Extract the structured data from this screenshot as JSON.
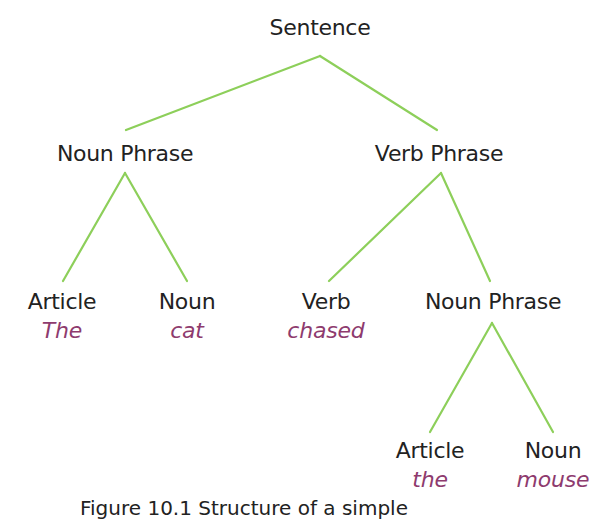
{
  "diagram": {
    "type": "parse-tree",
    "edge_color": "#8dcf5a",
    "word_color": "#8e3b6e",
    "nodes": [
      {
        "id": "s",
        "label": "Sentence",
        "word": null,
        "x": 320,
        "y": 14
      },
      {
        "id": "np1",
        "label": "Noun Phrase",
        "word": null,
        "x": 125,
        "y": 140
      },
      {
        "id": "vp",
        "label": "Verb Phrase",
        "word": null,
        "x": 439,
        "y": 140
      },
      {
        "id": "art1",
        "label": "Article",
        "word": "The",
        "x": 62,
        "y": 288
      },
      {
        "id": "n1",
        "label": "Noun",
        "word": "cat",
        "x": 187,
        "y": 288
      },
      {
        "id": "v",
        "label": "Verb",
        "word": "chased",
        "x": 326,
        "y": 288
      },
      {
        "id": "np2",
        "label": "Noun Phrase",
        "word": null,
        "x": 493,
        "y": 288
      },
      {
        "id": "art2",
        "label": "Article",
        "word": "the",
        "x": 430,
        "y": 437
      },
      {
        "id": "n2",
        "label": "Noun",
        "word": "mouse",
        "x": 553,
        "y": 437
      }
    ],
    "edges": [
      {
        "from": "s",
        "to": "np1",
        "x1": 320,
        "y1": 56,
        "x2": 126,
        "y2": 130
      },
      {
        "from": "s",
        "to": "vp",
        "x1": 320,
        "y1": 56,
        "x2": 437,
        "y2": 130
      },
      {
        "from": "np1",
        "to": "art1",
        "x1": 125,
        "y1": 173,
        "x2": 63,
        "y2": 281
      },
      {
        "from": "np1",
        "to": "n1",
        "x1": 125,
        "y1": 173,
        "x2": 187,
        "y2": 281
      },
      {
        "from": "vp",
        "to": "v",
        "x1": 441,
        "y1": 173,
        "x2": 329,
        "y2": 281
      },
      {
        "from": "vp",
        "to": "np2",
        "x1": 441,
        "y1": 173,
        "x2": 490,
        "y2": 281
      },
      {
        "from": "np2",
        "to": "art2",
        "x1": 492,
        "y1": 323,
        "x2": 430,
        "y2": 432
      },
      {
        "from": "np2",
        "to": "n2",
        "x1": 492,
        "y1": 323,
        "x2": 553,
        "y2": 432
      }
    ]
  },
  "caption": "Figure 10.1 Structure of a simple"
}
